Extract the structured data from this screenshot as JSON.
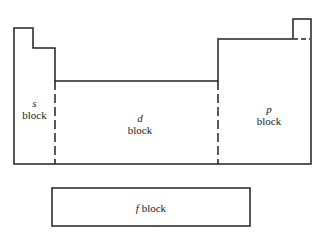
{
  "diagram": {
    "blocks": [
      {
        "id": "s",
        "letter": "s",
        "word": "block"
      },
      {
        "id": "d",
        "letter": "d",
        "word": "block"
      },
      {
        "id": "p",
        "letter": "p",
        "word": "block"
      },
      {
        "id": "f",
        "letter": "f",
        "word": "block"
      }
    ],
    "colors": {
      "line": "#222222",
      "background": "#ffffff"
    }
  }
}
